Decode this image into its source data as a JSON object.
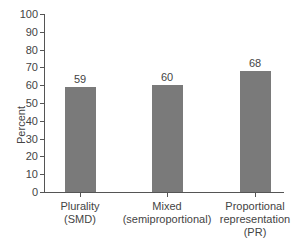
{
  "chart_data": {
    "type": "bar",
    "title": "",
    "xlabel": "",
    "ylabel": "Percent",
    "ylim": [
      0,
      100
    ],
    "yticks": [
      "0",
      "10",
      "20",
      "30",
      "40",
      "50",
      "60",
      "70",
      "80",
      "90",
      "100"
    ],
    "categories": [
      "Plurality (SMD)",
      "Mixed (semiproportional)",
      "Proportional representation (PR)"
    ],
    "category_lines": [
      [
        "Plurality",
        "(SMD)"
      ],
      [
        "Mixed",
        "(semiproportional)"
      ],
      [
        "Proportional",
        "representation",
        "(PR)"
      ]
    ],
    "values": [
      59,
      60,
      68
    ],
    "value_labels": [
      "59",
      "60",
      "68"
    ],
    "bar_color": "#7a7a7a",
    "grid": false,
    "legend": null
  }
}
